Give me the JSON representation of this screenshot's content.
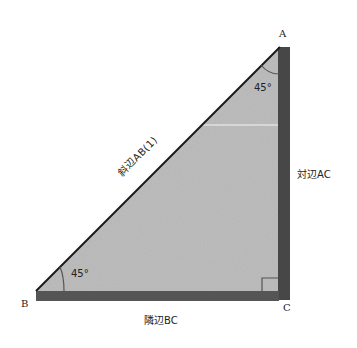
{
  "diagram": {
    "type": "right-triangle",
    "vertices": {
      "A": {
        "label": "A"
      },
      "B": {
        "label": "B"
      },
      "C": {
        "label": "C"
      }
    },
    "angles": {
      "A": {
        "label": "45°"
      },
      "B": {
        "label": "45°"
      },
      "C": {
        "label": "right-angle"
      }
    },
    "sides": {
      "hypotenuse": {
        "label": "斜辺AB(1)"
      },
      "opposite": {
        "label": "対辺AC"
      },
      "adjacent": {
        "label": "隣辺BC"
      }
    },
    "colors": {
      "fill": "#b8b8b8",
      "thick_side": "#4a4a4a",
      "hypotenuse_line": "#1a1a1a",
      "background": "#ffffff"
    }
  }
}
